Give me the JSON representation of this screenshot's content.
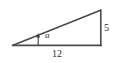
{
  "figure": {
    "kind": "right-triangle-diagram",
    "background_color": "#ffffff",
    "stroke_color": "#4a4a4a",
    "text_color": "#2b2b2b",
    "labels": {
      "angle": "a",
      "opposite_side": "5",
      "adjacent_side": "12"
    },
    "geometry": {
      "left_vertex": [
        13,
        45
      ],
      "apex_vertex": [
        101,
        10
      ],
      "right_angle_vertex": [
        101,
        45
      ],
      "base_length_label": "12",
      "height_length_label": "5"
    },
    "angle_pointer": {
      "name": "angle-arrow",
      "from": [
        38,
        45
      ],
      "to": [
        38,
        34
      ]
    }
  }
}
